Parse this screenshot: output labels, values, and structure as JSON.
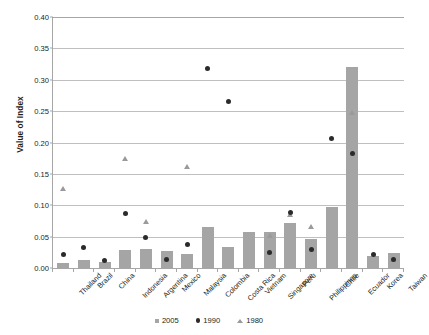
{
  "chart_data": {
    "type": "bar",
    "title": "",
    "xlabel": "",
    "ylabel": "Value of Index",
    "ylim": [
      0.0,
      0.4
    ],
    "ytick_labels": [
      "0.00",
      "0.05",
      "0.10",
      "0.15",
      "0.20",
      "0.25",
      "0.30",
      "0.35",
      "0.40"
    ],
    "ytick_values": [
      0.0,
      0.05,
      0.1,
      0.15,
      0.2,
      0.25,
      0.3,
      0.35,
      0.4
    ],
    "grid": true,
    "legend_position": "bottom",
    "categories": [
      "Thailand",
      "Brazil",
      "China",
      "Indonesia",
      "Argentina",
      "Mexico",
      "Malaysia",
      "Colombia",
      "Costa Rica",
      "Vietnam",
      "Singapore",
      "Peru",
      "Philippines",
      "Chile",
      "Ecuador",
      "Korea",
      "Taiwan"
    ],
    "series": [
      {
        "name": "2005",
        "marker": "square",
        "render": "bar",
        "color": "#a5a5a5",
        "values": [
          0.008,
          0.012,
          0.009,
          0.028,
          0.03,
          0.027,
          0.023,
          0.066,
          0.034,
          0.057,
          0.057,
          0.072,
          0.047,
          0.097,
          0.32,
          0.019,
          0.024
        ]
      },
      {
        "name": "1990",
        "marker": "circle",
        "render": "point",
        "color": "#2b2b2b",
        "values": [
          0.021,
          0.033,
          0.012,
          0.087,
          0.048,
          0.013,
          0.038,
          0.318,
          0.265,
          null,
          0.025,
          0.088,
          0.029,
          0.207,
          0.183,
          0.021,
          0.014
        ]
      },
      {
        "name": "1980",
        "marker": "triangle",
        "render": "point",
        "color": "#9a9a9a",
        "values": [
          0.124,
          null,
          null,
          0.172,
          0.071,
          null,
          0.16,
          null,
          null,
          null,
          0.05,
          0.083,
          0.063,
          null,
          0.245,
          null,
          0.011
        ]
      }
    ]
  }
}
